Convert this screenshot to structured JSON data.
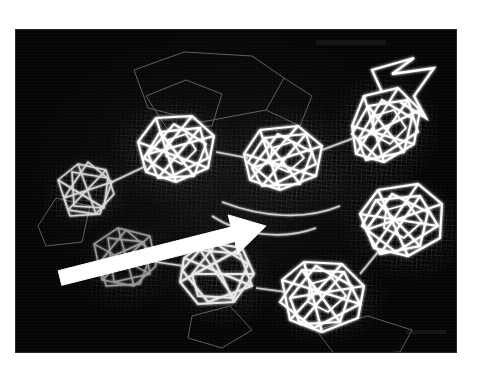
{
  "figure": {
    "domain": "scientific-figure",
    "kind": "crystallographic-electron-density-map",
    "panel_background": "#050505",
    "page_background": "#ffffff",
    "mesh_color": "#d8d8d8",
    "wire_color": "#ffffff",
    "faint_color": "#6a6a6a",
    "annotation_color": "#ffffff",
    "panel": {
      "x": 16,
      "y": 30,
      "width": 440,
      "height": 322
    }
  },
  "annotations": [
    {
      "name": "pointer-arrow",
      "type": "arrow",
      "color": "#ffffff",
      "tail_x": 44,
      "tail_y": 248,
      "tip_x": 250,
      "tip_y": 196,
      "label": ""
    }
  ],
  "clusters": [
    {
      "id": "cluster-1",
      "label": "",
      "cx": 70,
      "cy": 162,
      "r": 34,
      "brightness": "medium",
      "blob_rx": 46,
      "blob_ry": 40,
      "blob_rot": -12
    },
    {
      "id": "cluster-2",
      "label": "",
      "cx": 158,
      "cy": 122,
      "r": 52,
      "brightness": "high",
      "blob_rx": 68,
      "blob_ry": 58,
      "blob_rot": 8
    },
    {
      "id": "cluster-3",
      "label": "",
      "cx": 272,
      "cy": 130,
      "r": 54,
      "brightness": "high",
      "blob_rx": 70,
      "blob_ry": 58,
      "blob_rot": -6
    },
    {
      "id": "cluster-4",
      "label": "",
      "cx": 368,
      "cy": 100,
      "r": 48,
      "brightness": "high",
      "blob_rx": 58,
      "blob_ry": 64,
      "blob_rot": 14
    },
    {
      "id": "cluster-5",
      "label": "",
      "cx": 112,
      "cy": 236,
      "r": 42,
      "brightness": "low",
      "blob_rx": 56,
      "blob_ry": 48,
      "blob_rot": -18
    },
    {
      "id": "cluster-6",
      "label": "",
      "cx": 206,
      "cy": 250,
      "r": 44,
      "brightness": "medium",
      "blob_rx": 56,
      "blob_ry": 50,
      "blob_rot": 10
    },
    {
      "id": "cluster-7",
      "label": "",
      "cx": 312,
      "cy": 268,
      "r": 46,
      "brightness": "high",
      "blob_rx": 62,
      "blob_ry": 48,
      "blob_rot": -8
    },
    {
      "id": "cluster-8",
      "label": "",
      "cx": 388,
      "cy": 198,
      "r": 48,
      "brightness": "high",
      "blob_rx": 66,
      "blob_ry": 54,
      "blob_rot": 6
    }
  ],
  "faint_outlines": [
    {
      "id": "outline-top",
      "points": "118,40 168,22 236,26 268,48 250,80 186,92 132,78"
    },
    {
      "id": "outline-top-inner",
      "points": "130,66 170,50 206,64 196,96 152,100"
    },
    {
      "id": "outline-lower-right",
      "points": "300,300 352,286 396,300 384,322 320,326"
    }
  ],
  "connectors": [
    {
      "id": "link-1-2",
      "x1": 96,
      "y1": 152,
      "x2": 128,
      "y2": 134
    },
    {
      "id": "link-2-3",
      "x1": 206,
      "y1": 122,
      "x2": 236,
      "y2": 126
    },
    {
      "id": "link-3-4",
      "x1": 318,
      "y1": 118,
      "x2": 340,
      "y2": 110
    },
    {
      "id": "link-7-8",
      "x1": 348,
      "y1": 248,
      "x2": 366,
      "y2": 226
    },
    {
      "id": "link-6-7",
      "x1": 246,
      "y1": 262,
      "x2": 274,
      "y2": 266
    }
  ]
}
